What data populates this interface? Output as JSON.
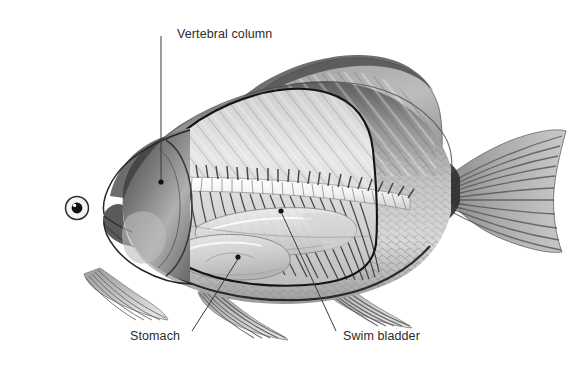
{
  "figure": {
    "kind": "anatomical-illustration",
    "medium": "grayscale pencil / halftone engraving",
    "background_color": "#ffffff",
    "border_color": "#b9b9b9"
  },
  "labels": {
    "vertebral_column": "Vertebral column",
    "stomach": "Stomach",
    "swim_bladder": "Swim bladder"
  },
  "callouts": [
    {
      "name": "vertebral-column",
      "text": "Vertebral column",
      "text_x": 177,
      "text_y": 27,
      "leader": [
        [
          161,
          36
        ],
        [
          161,
          182
        ]
      ],
      "dot": null
    },
    {
      "name": "stomach",
      "text": "Stomach",
      "text_x": 130,
      "text_y": 329,
      "leader": [
        [
          192,
          331
        ],
        [
          238,
          258
        ]
      ],
      "dot": [
        238,
        257
      ]
    },
    {
      "name": "swim-bladder",
      "text": "Swim bladder",
      "text_x": 343,
      "text_y": 329,
      "leader": [
        [
          335,
          331
        ],
        [
          282,
          212
        ]
      ],
      "dot": [
        281,
        211
      ]
    }
  ],
  "palette": {
    "ink": "#2b2b2b",
    "leader_line": "#3a3a3a",
    "body_mid": "#b3b3b3",
    "body_light": "#e2e2e2",
    "body_dark": "#6a6a6a",
    "outline_dark": "#1a1a1a",
    "fin_gray": "#9a9a9a",
    "white": "#ffffff"
  }
}
